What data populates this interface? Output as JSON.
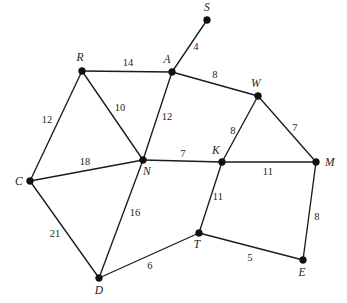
{
  "figure": {
    "type": "weighted-undirected-graph",
    "background_color": "#ffffff",
    "stroke_color": "#1c1c1c",
    "label_color": "#242424",
    "width": 347,
    "height": 303
  },
  "chart_data": {
    "type": "diagram",
    "subtype": "weighted graph / network",
    "title": "",
    "xlabel": "",
    "ylabel": "",
    "grid": false,
    "legend": "none",
    "node_count": 11,
    "edge_count": 17,
    "nodes": [
      {
        "id": "S",
        "label": "S",
        "x": 207,
        "y": 20,
        "label_x": 207,
        "label_y": 8
      },
      {
        "id": "R",
        "label": "R",
        "x": 82,
        "y": 71,
        "label_x": 80,
        "label_y": 58
      },
      {
        "id": "A",
        "label": "A",
        "x": 172,
        "y": 72,
        "label_x": 167,
        "label_y": 60
      },
      {
        "id": "W",
        "label": "W",
        "x": 258,
        "y": 96,
        "label_x": 256,
        "label_y": 84
      },
      {
        "id": "C",
        "label": "C",
        "x": 30,
        "y": 181,
        "label_x": 19,
        "label_y": 182
      },
      {
        "id": "N",
        "label": "N",
        "x": 143,
        "y": 160,
        "label_x": 147,
        "label_y": 172
      },
      {
        "id": "K",
        "label": "K",
        "x": 222,
        "y": 162,
        "label_x": 216,
        "label_y": 151
      },
      {
        "id": "M",
        "label": "M",
        "x": 316,
        "y": 162,
        "label_x": 330,
        "label_y": 163
      },
      {
        "id": "T",
        "label": "T",
        "x": 199,
        "y": 233,
        "label_x": 197,
        "label_y": 245
      },
      {
        "id": "D",
        "label": "D",
        "x": 99,
        "y": 278,
        "label_x": 99,
        "label_y": 291
      },
      {
        "id": "E",
        "label": "E",
        "x": 303,
        "y": 260,
        "label_x": 302,
        "label_y": 273
      }
    ],
    "edges": [
      {
        "from": "A",
        "to": "S",
        "weight": 4,
        "label": "4",
        "label_x": 196,
        "label_y": 47
      },
      {
        "from": "R",
        "to": "A",
        "weight": 14,
        "label": "14",
        "label_x": 128,
        "label_y": 63
      },
      {
        "from": "A",
        "to": "W",
        "weight": 8,
        "label": "8",
        "label_x": 215,
        "label_y": 75
      },
      {
        "from": "R",
        "to": "C",
        "weight": 12,
        "label": "12",
        "label_x": 47,
        "label_y": 120
      },
      {
        "from": "R",
        "to": "N",
        "weight": 10,
        "label": "10",
        "label_x": 120,
        "label_y": 108
      },
      {
        "from": "A",
        "to": "N",
        "weight": 12,
        "label": "12",
        "label_x": 167,
        "label_y": 117
      },
      {
        "from": "W",
        "to": "K",
        "weight": 8,
        "label": "8",
        "label_x": 233,
        "label_y": 131
      },
      {
        "from": "W",
        "to": "M",
        "weight": 7,
        "label": "7",
        "label_x": 295,
        "label_y": 128
      },
      {
        "from": "C",
        "to": "N",
        "weight": 18,
        "label": "18",
        "label_x": 85,
        "label_y": 162
      },
      {
        "from": "N",
        "to": "K",
        "weight": 7,
        "label": "7",
        "label_x": 183,
        "label_y": 154
      },
      {
        "from": "K",
        "to": "M",
        "weight": 11,
        "label": "11",
        "label_x": 268,
        "label_y": 172
      },
      {
        "from": "N",
        "to": "D",
        "weight": 16,
        "label": "16",
        "label_x": 135,
        "label_y": 213
      },
      {
        "from": "K",
        "to": "T",
        "weight": 11,
        "label": "11",
        "label_x": 218,
        "label_y": 197
      },
      {
        "from": "C",
        "to": "D",
        "weight": 21,
        "label": "21",
        "label_x": 55,
        "label_y": 234
      },
      {
        "from": "M",
        "to": "E",
        "weight": 8,
        "label": "8",
        "label_x": 317,
        "label_y": 217
      },
      {
        "from": "D",
        "to": "T",
        "weight": 6,
        "label": "6",
        "label_x": 150,
        "label_y": 266
      },
      {
        "from": "T",
        "to": "E",
        "weight": 5,
        "label": "5",
        "label_x": 250,
        "label_y": 258
      }
    ]
  }
}
